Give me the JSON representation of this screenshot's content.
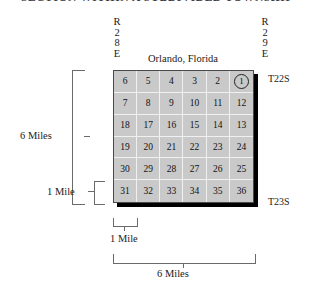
{
  "figure": {
    "title": "SECTION WITHIN A SUBDIVIDED TOWNSHIP",
    "caption": "Orlando, Florida"
  },
  "range_labels": {
    "left": [
      "R",
      "2",
      "8",
      "E"
    ],
    "right": [
      "R",
      "2",
      "9",
      "E"
    ]
  },
  "township_labels": {
    "top": "T22S",
    "bottom": "T23S"
  },
  "measurements": {
    "vertical_full": "6 Miles",
    "vertical_single": "1 Mile",
    "horizontal_single": "1 Mile",
    "horizontal_full": "6 Miles"
  },
  "grid": {
    "rows": 6,
    "columns": 6,
    "highlighted_section": "1",
    "sections": [
      [
        "6",
        "5",
        "4",
        "3",
        "2",
        "1"
      ],
      [
        "7",
        "8",
        "9",
        "10",
        "11",
        "12"
      ],
      [
        "18",
        "17",
        "16",
        "15",
        "14",
        "13"
      ],
      [
        "19",
        "20",
        "21",
        "22",
        "23",
        "24"
      ],
      [
        "30",
        "29",
        "28",
        "27",
        "26",
        "25"
      ],
      [
        "31",
        "32",
        "33",
        "34",
        "35",
        "36"
      ]
    ]
  },
  "colors": {
    "cell_fill": "#c9c9c9",
    "grid_line": "#f0f0f0",
    "grid_border": "#4a4a4a",
    "shadow": "#000000",
    "bracket": "#6a6a6a",
    "text": "#1a1a1a"
  }
}
